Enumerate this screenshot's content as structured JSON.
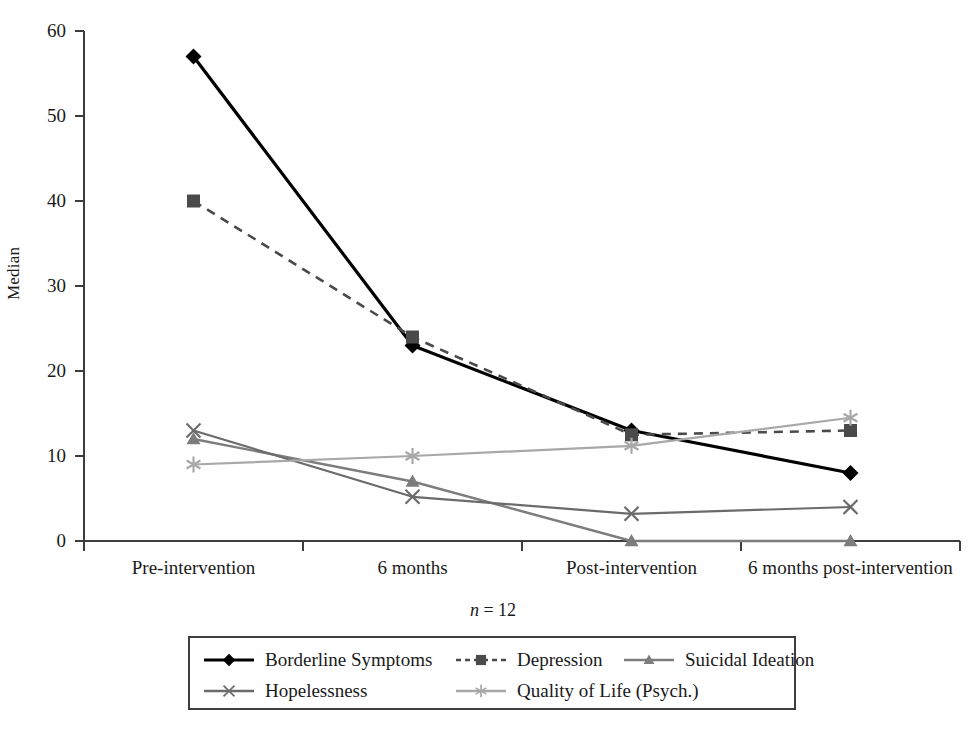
{
  "chart_data": {
    "type": "line",
    "title": "",
    "xlabel": "",
    "ylabel": "Median",
    "note": "n = 12",
    "note_italic_part": "n",
    "note_rest": " = 12",
    "categories": [
      "Pre-intervention",
      "6 months",
      "Post-intervention",
      "6 months post-intervention"
    ],
    "ylim": [
      0,
      60
    ],
    "yticks": [
      0,
      10,
      20,
      30,
      40,
      50,
      60
    ],
    "ytick_labels": [
      "0",
      "10",
      "20",
      "30",
      "40",
      "50",
      "60"
    ],
    "grid": false,
    "legend_position": "bottom",
    "series": [
      {
        "name": "Borderline Symptoms",
        "values": [
          57,
          23,
          13,
          8
        ],
        "color": "#000000",
        "marker": "diamond",
        "dash": "solid",
        "width": 3.2
      },
      {
        "name": "Depression",
        "values": [
          40,
          24,
          12.5,
          13
        ],
        "color": "#4a4a4a",
        "marker": "square",
        "dash": "dashed",
        "width": 2.6
      },
      {
        "name": "Suicidal Ideation",
        "values": [
          12,
          7,
          0,
          0
        ],
        "color": "#7d7d7d",
        "marker": "triangle",
        "dash": "solid",
        "width": 2.4
      },
      {
        "name": "Hopelessness",
        "values": [
          13,
          5.2,
          3.2,
          4
        ],
        "color": "#6b6b6b",
        "marker": "cross",
        "dash": "solid",
        "width": 2.2
      },
      {
        "name": "Quality of Life (Psych.)",
        "values": [
          9,
          10,
          11.2,
          14.5
        ],
        "color": "#a8a8a8",
        "marker": "asterisk",
        "dash": "solid",
        "width": 2.2
      }
    ]
  },
  "axis": {
    "y_label": "Median",
    "y_ticks": [
      "60",
      "50",
      "40",
      "30",
      "20",
      "10",
      "0"
    ],
    "x_ticks": [
      "Pre-intervention",
      "6 months",
      "Post-intervention",
      "6 months post-intervention"
    ]
  },
  "legend": {
    "rows": [
      [
        {
          "label": "Borderline Symptoms",
          "marker": "diamond",
          "dash": "solid",
          "color": "#000000"
        },
        {
          "label": "Depression",
          "marker": "square",
          "dash": "dashed",
          "color": "#4a4a4a"
        },
        {
          "label": "Suicidal Ideation",
          "marker": "triangle",
          "dash": "solid",
          "color": "#7d7d7d"
        }
      ],
      [
        {
          "label": "Hopelessness",
          "marker": "cross",
          "dash": "solid",
          "color": "#6b6b6b"
        },
        {
          "label": "Quality of Life (Psych.)",
          "marker": "asterisk",
          "dash": "solid",
          "color": "#a8a8a8"
        }
      ]
    ]
  },
  "colors": {
    "axis": "#3d3d3d",
    "background": "#ffffff",
    "text": "#1a1a1a"
  }
}
